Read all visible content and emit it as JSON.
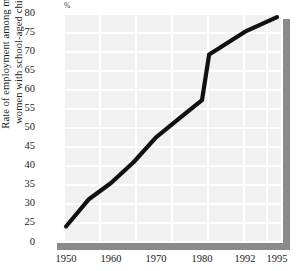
{
  "chart_data": {
    "type": "line",
    "title": "",
    "subtitle": "",
    "xlabel": "",
    "ylabel": "Rate of employment among married women with school-aged children",
    "ylabel_lines": [
      "Rate of employment among married",
      "women with school-aged children"
    ],
    "unit_label": "%",
    "x_tick_labels": [
      "1950",
      "1960",
      "1970",
      "1980",
      "1992",
      "1995"
    ],
    "y_tick_labels": [
      "0",
      "25",
      "30",
      "35",
      "40",
      "45",
      "50",
      "55",
      "60",
      "65",
      "70",
      "75",
      "80"
    ],
    "ylim": [
      25,
      80
    ],
    "y_axis_has_break": true,
    "y_axis_zero_label": "0",
    "grid": true,
    "legend": "none",
    "x": [
      1950,
      1955,
      1960,
      1965,
      1970,
      1975,
      1980,
      1982,
      1992,
      1995
    ],
    "values": [
      28.5,
      35.0,
      39.0,
      44.0,
      50.0,
      54.5,
      59.0,
      70.0,
      75.5,
      79.0
    ],
    "series": [
      {
        "name": "Rate of employment among married women with school-aged children",
        "color": "#111111",
        "values": [
          28.5,
          35.0,
          39.0,
          44.0,
          50.0,
          54.5,
          59.0,
          70.0,
          75.5,
          79.0
        ]
      }
    ],
    "colors": {
      "line": "#111111",
      "plot_background": "#f1f1f1",
      "gridline": "#ffffff",
      "shadow": "#8a8a8a",
      "text": "#1a1a1a"
    }
  }
}
